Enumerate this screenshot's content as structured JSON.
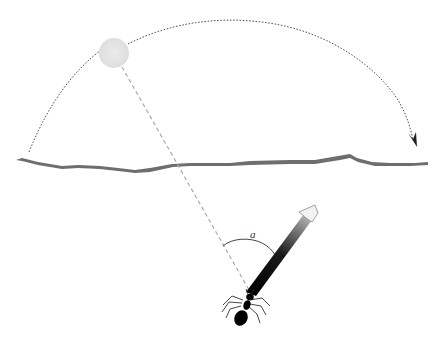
{
  "diagram": {
    "angle_label": "a",
    "elements": {
      "sun": {
        "label": "sun",
        "color": "#e6e6e6",
        "cx": 114,
        "cy": 53,
        "r": 15
      },
      "sun_path": {
        "label": "sun-trajectory arc",
        "style": "dotted",
        "color": "#555555",
        "direction": "left-to-right"
      },
      "horizon": {
        "label": "horizon line",
        "color": "#6e6e6e"
      },
      "sun_ray": {
        "label": "line from sun to ant",
        "style": "dashed",
        "color": "#aaaaaa"
      },
      "heading_arrow": {
        "label": "ant heading arrow",
        "gradient": [
          "#000000",
          "#ffffff"
        ]
      },
      "ant": {
        "label": "ant",
        "color": "#000000"
      },
      "angle_arc": {
        "label": "angle between sun direction and heading",
        "color": "#444444"
      }
    },
    "colors": {
      "background": "#ffffff",
      "horizon": "#6e6e6e",
      "sun_fill": "#e6e6e6",
      "dotted_arc": "#555555",
      "dashed_ray": "#aaaaaa",
      "ant": "#000000"
    }
  }
}
